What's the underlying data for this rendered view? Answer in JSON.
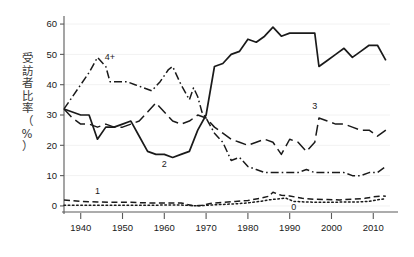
{
  "chart_data": {
    "type": "line",
    "title": "",
    "xlabel": "",
    "ylabel": "受訪者比率（%）",
    "xlim": [
      1936,
      2014
    ],
    "ylim": [
      -2,
      62
    ],
    "xticks": [
      1940,
      1950,
      1960,
      1970,
      1980,
      1990,
      2000,
      2010
    ],
    "yticks": [
      0,
      10,
      20,
      30,
      40,
      50,
      60
    ],
    "grid": false,
    "legend_position": "inline-annotations",
    "series": [
      {
        "name": "2",
        "label": "2",
        "style": "solid",
        "color": "#1a1a1a",
        "label_x": 1960,
        "label_y": 13,
        "x": [
          1936,
          1938,
          1940,
          1942,
          1944,
          1946,
          1948,
          1950,
          1952,
          1954,
          1956,
          1958,
          1960,
          1962,
          1964,
          1966,
          1968,
          1970,
          1972,
          1974,
          1976,
          1978,
          1980,
          1982,
          1984,
          1986,
          1988,
          1990,
          1992,
          1994,
          1996,
          1997,
          1999,
          2001,
          2003,
          2005,
          2007,
          2009,
          2011,
          2013
        ],
        "y": [
          32,
          31,
          30,
          30,
          22,
          26,
          26,
          27,
          28,
          23,
          18,
          17,
          17,
          16,
          17,
          18,
          25,
          30,
          46,
          47,
          50,
          51,
          55,
          54,
          56,
          59,
          56,
          57,
          57,
          57,
          57,
          46,
          48,
          50,
          52,
          49,
          51,
          53,
          53,
          48
        ]
      },
      {
        "name": "3",
        "label": "3",
        "style": "long-dash",
        "color": "#1a1a1a",
        "label_x": 1996,
        "label_y": 32,
        "x": [
          1936,
          1938,
          1940,
          1942,
          1944,
          1946,
          1948,
          1950,
          1952,
          1954,
          1956,
          1958,
          1960,
          1962,
          1964,
          1966,
          1968,
          1970,
          1972,
          1974,
          1976,
          1978,
          1980,
          1982,
          1984,
          1986,
          1988,
          1990,
          1992,
          1994,
          1996,
          1997,
          1999,
          2001,
          2003,
          2005,
          2007,
          2009,
          2011,
          2013
        ],
        "y": [
          32,
          29,
          27,
          27,
          26,
          27,
          26,
          26,
          27,
          28,
          31,
          34,
          31,
          28,
          27,
          28,
          30,
          29,
          26,
          24,
          22,
          21,
          20,
          21,
          22,
          21,
          17,
          22,
          21,
          18,
          21,
          29,
          28,
          27,
          27,
          26,
          25,
          25,
          23,
          25
        ]
      },
      {
        "name": "4+",
        "label": "4+",
        "style": "dash-dot",
        "color": "#1a1a1a",
        "label_x": 1947,
        "label_y": 48,
        "x": [
          1936,
          1938,
          1940,
          1942,
          1944,
          1946,
          1947,
          1949,
          1951,
          1953,
          1955,
          1957,
          1959,
          1961,
          1962,
          1964,
          1966,
          1967,
          1968,
          1969,
          1970,
          1972,
          1974,
          1976,
          1978,
          1980,
          1982,
          1984,
          1986,
          1988,
          1990,
          1992,
          1994,
          1996,
          1999,
          2001,
          2003,
          2005,
          2007,
          2009,
          2011,
          2013
        ],
        "y": [
          32,
          36,
          40,
          44,
          49,
          46,
          41,
          41,
          41,
          40,
          39,
          38,
          41,
          45,
          46,
          40,
          35,
          39,
          36,
          31,
          29,
          24,
          21,
          15,
          16,
          13,
          12,
          11,
          11,
          11,
          11,
          11,
          12,
          11,
          11,
          11,
          11,
          10,
          10,
          11,
          11,
          13
        ]
      },
      {
        "name": "1",
        "label": "1",
        "style": "dash",
        "color": "#1a1a1a",
        "label_x": 1944,
        "label_y": 4,
        "x": [
          1936,
          1940,
          1944,
          1948,
          1952,
          1956,
          1960,
          1964,
          1967,
          1969,
          1971,
          1974,
          1977,
          1980,
          1983,
          1985,
          1986,
          1988,
          1990,
          1993,
          1996,
          1999,
          2002,
          2005,
          2008,
          2010,
          2012,
          2013
        ],
        "y": [
          2,
          1.5,
          1.3,
          1.2,
          1.2,
          1,
          1,
          1,
          0,
          0.2,
          0.8,
          1.2,
          1.5,
          1.8,
          2.5,
          3.2,
          4.5,
          3.5,
          3.3,
          2.5,
          2.2,
          2.1,
          2,
          2.2,
          2.5,
          3,
          3.3,
          3.2
        ]
      },
      {
        "name": "0",
        "label": "0",
        "style": "dot",
        "color": "#1a1a1a",
        "label_x": 1991,
        "label_y": -1.2,
        "x": [
          1936,
          1940,
          1944,
          1948,
          1952,
          1956,
          1960,
          1964,
          1967,
          1969,
          1971,
          1974,
          1977,
          1980,
          1983,
          1985,
          1987,
          1989,
          1991,
          1994,
          1997,
          2000,
          2003,
          2006,
          2009,
          2011,
          2013
        ],
        "y": [
          0.2,
          0.2,
          0.2,
          0.2,
          0.2,
          0.2,
          0.3,
          0.3,
          0.1,
          0.1,
          0.3,
          0.5,
          0.7,
          1,
          1.5,
          2,
          2.3,
          2.6,
          1.5,
          1.3,
          1.2,
          1.2,
          1.3,
          1.3,
          1.5,
          2,
          2.4
        ]
      }
    ]
  },
  "axis": {
    "y_tick_labels": [
      "0",
      "10",
      "20",
      "30",
      "40",
      "50",
      "60"
    ],
    "x_tick_labels": [
      "1940",
      "1950",
      "1960",
      "1970",
      "1980",
      "1990",
      "2000",
      "2010"
    ],
    "y_axis_title_chars": [
      "受",
      "訪",
      "者",
      "比",
      "率",
      "（",
      "%",
      "）"
    ]
  },
  "colors": {
    "line": "#1a1a1a",
    "axis": "#5a5a5a",
    "background": "#ffffff",
    "label_text": "#3a3a3a"
  }
}
